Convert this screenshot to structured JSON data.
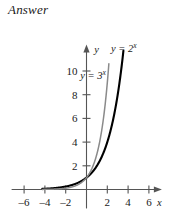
{
  "page": {
    "heading": "Answer"
  },
  "chart_data": {
    "type": "line",
    "title": "",
    "xlabel": "x",
    "ylabel": "y",
    "xlim": [
      -7.2,
      7.2
    ],
    "ylim": [
      -1.6,
      12.2
    ],
    "grid": false,
    "legend_position": "inline-annotations",
    "xticks": [
      -6,
      -4,
      -2,
      2,
      4,
      6
    ],
    "xtick_labels": [
      "-6",
      "-4",
      "-2",
      "2",
      "4",
      "6"
    ],
    "yticks": [
      2,
      4,
      6,
      8,
      10
    ],
    "ytick_labels": [
      "2",
      "4",
      "6",
      "8",
      "10"
    ],
    "axis_arrows": [
      "x-right",
      "y-up"
    ],
    "series": [
      {
        "name": "y = 2^x",
        "label_base": "y = 2",
        "label_exponent": "x",
        "color": "#000000",
        "width": 2.1,
        "base": 2,
        "x_start": -4.25,
        "x_end": 3.55,
        "label_x": 2.35,
        "label_y": 11.6
      },
      {
        "name": "y = 3^x",
        "label_base": "y = 3",
        "label_exponent": "x",
        "color": "#8a8a8a",
        "width": 1.5,
        "base": 3,
        "x_start": -4.25,
        "x_end": 2.15,
        "label_x": -0.6,
        "label_y": 9.3
      }
    ],
    "axis_color": "#555555",
    "tick_color": "#555555"
  }
}
